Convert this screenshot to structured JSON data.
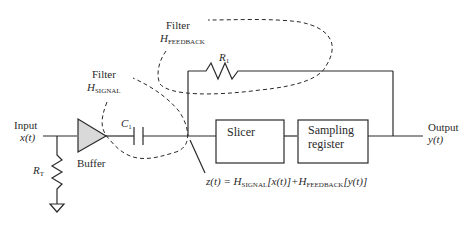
{
  "diagram": {
    "input": {
      "label": "Input",
      "signal": "x(t)"
    },
    "output": {
      "label": "Output",
      "signal": "y(t)"
    },
    "buffer": {
      "label": "Buffer"
    },
    "rt": {
      "main": "R",
      "sub": "T"
    },
    "c1": {
      "main": "C",
      "sub": "1"
    },
    "r1": {
      "main": "R",
      "sub": "1"
    },
    "filter_signal": {
      "label": "Filter",
      "main": "H",
      "sub": "SIGNAL"
    },
    "filter_feedback": {
      "label": "Filter",
      "main": "H",
      "sub": "FEEDBACK"
    },
    "slicer": {
      "label": "Slicer"
    },
    "sampling": {
      "line1": "Sampling",
      "line2": "register"
    },
    "equation": {
      "lhs": "z(t) = ",
      "h1": "H",
      "h1sub": "SIGNAL",
      "arg1": "[x(t)]+",
      "h2": "H",
      "h2sub": "FEEDBACK",
      "arg2": "[y(t)]"
    },
    "colors": {
      "line": "#2a2a2a",
      "buffer_fill": "#d9d9d9"
    }
  }
}
